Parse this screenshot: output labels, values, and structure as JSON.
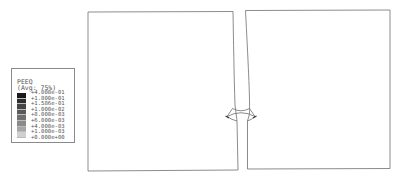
{
  "legend": {
    "variable": "PEEQ",
    "averaging": "(Avg: 75%)",
    "levels": [
      "+4.000e-01",
      "+1.800e-01",
      "+1.586e-01",
      "+1.000e-02",
      "+8.000e-03",
      "+6.000e-03",
      "+4.000e-03",
      "+1.000e-03",
      "+0.000e+00"
    ],
    "colors": [
      "#1a1a1a",
      "#2e2e2e",
      "#454545",
      "#5a5a5a",
      "#707070",
      "#8a8a8a",
      "#a6a6a6",
      "#d0d0d0"
    ]
  },
  "diagram": {
    "line_color": "#6e6e6e",
    "left_plate": {
      "x1": 87,
      "y1": 12,
      "x2": 238,
      "y2": 171
    },
    "right_plate": {
      "x1": 245,
      "y1": 10,
      "x2": 390,
      "y2": 169
    }
  }
}
